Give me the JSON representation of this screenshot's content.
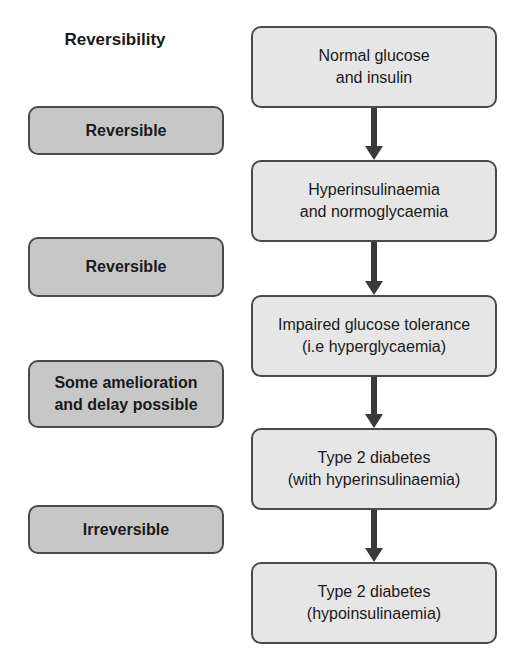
{
  "heading": "Reversibility",
  "stages": [
    {
      "line1": "Normal glucose",
      "line2": "and insulin"
    },
    {
      "line1": "Hyperinsulinaemia",
      "line2": "and normoglycaemia"
    },
    {
      "line1": "Impaired glucose tolerance",
      "line2": "(i.e hyperglycaemia)"
    },
    {
      "line1": "Type 2 diabetes",
      "line2": "(with hyperinsulinaemia)"
    },
    {
      "line1": "Type 2 diabetes",
      "line2": "(hypoinsulinaemia)"
    }
  ],
  "reversibility": [
    {
      "line1": "Reversible",
      "line2": ""
    },
    {
      "line1": "Reversible",
      "line2": ""
    },
    {
      "line1": "Some amelioration",
      "line2": "and delay possible"
    },
    {
      "line1": "Irreversible",
      "line2": ""
    }
  ],
  "colors": {
    "stage_fill": "#e6e6e6",
    "reversibility_fill": "#c7c7c7",
    "border": "#4a4a4a",
    "arrow": "#3a3a3a"
  }
}
